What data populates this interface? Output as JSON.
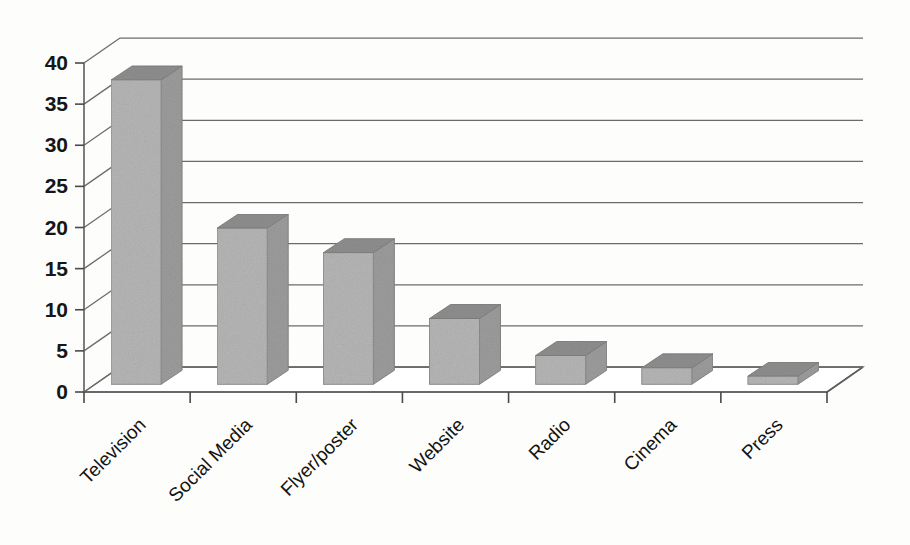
{
  "chart_data": {
    "type": "bar",
    "title": "",
    "subtitle": "",
    "xlabel": "",
    "ylabel": "",
    "style": "3d-column",
    "categories": [
      "Television",
      "Social Media",
      "Flyer/poster",
      "Website",
      "Radio",
      "Cinema",
      "Press"
    ],
    "values": [
      37,
      19,
      16,
      8,
      3.5,
      2,
      1
    ],
    "series": [
      {
        "name": "",
        "values": [
          37,
          19,
          16,
          8,
          3.5,
          2,
          1
        ]
      }
    ],
    "ylim": [
      0,
      40
    ],
    "yticks": [
      0,
      5,
      10,
      15,
      20,
      25,
      30,
      35,
      40
    ],
    "ytick_labels": [
      "0",
      "5",
      "10",
      "15",
      "20",
      "25",
      "30",
      "35",
      "40"
    ],
    "grid": true,
    "grid_axis": "y",
    "legend": false,
    "legend_position": "none",
    "xtick_label_rotation": 45,
    "annotations": []
  },
  "colors": {
    "background": "#fdfdfc",
    "bar_front": "#b6b6b6",
    "bar_side": "#9c9c9c",
    "bar_top": "#8e8e8e",
    "axis": "#5d5d5d",
    "gridline": "#6b6b6b",
    "text": "#161616"
  },
  "geometry": {
    "plot_left": 84,
    "plot_baseline_y": 392,
    "plot_right": 827,
    "y_top_value_y": 63,
    "depth_dx": 36,
    "depth_dy": -25,
    "bar_width": 50,
    "bar_depth_dx": 21,
    "bar_depth_dy": -14,
    "slot_width": 71.2
  }
}
